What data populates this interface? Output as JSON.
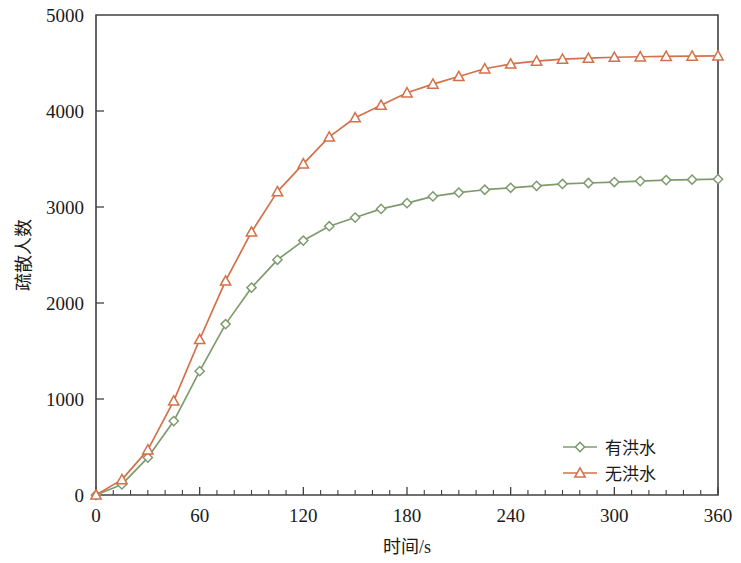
{
  "chart_data": {
    "type": "line",
    "title": "",
    "xlabel": "时间/s",
    "ylabel": "疏散人数",
    "xlim": [
      0,
      360
    ],
    "ylim": [
      0,
      5000
    ],
    "xticks": [
      0,
      60,
      120,
      180,
      240,
      300,
      360
    ],
    "xtick_labels": [
      "0",
      "60",
      "120",
      "180",
      "240",
      "300",
      "360"
    ],
    "x_minor_tick_step": 10,
    "yticks": [
      0,
      1000,
      2000,
      3000,
      4000,
      5000
    ],
    "ytick_labels": [
      "0",
      "1000",
      "2000",
      "3000",
      "4000",
      "5000"
    ],
    "grid": false,
    "legend_position": "lower-right-inside",
    "x": [
      0,
      15,
      30,
      45,
      60,
      75,
      90,
      105,
      120,
      135,
      150,
      165,
      180,
      195,
      210,
      225,
      240,
      255,
      270,
      285,
      300,
      315,
      330,
      345,
      360
    ],
    "series": [
      {
        "name": "有洪水",
        "color": "#7f9b6e",
        "marker": "diamond",
        "values": [
          0,
          110,
          390,
          770,
          1290,
          1780,
          2160,
          2450,
          2650,
          2800,
          2890,
          2980,
          3040,
          3110,
          3150,
          3180,
          3200,
          3220,
          3240,
          3250,
          3260,
          3270,
          3280,
          3285,
          3290
        ]
      },
      {
        "name": "无洪水",
        "color": "#d2714a",
        "marker": "triangle",
        "values": [
          0,
          160,
          470,
          980,
          1620,
          2230,
          2740,
          3160,
          3450,
          3730,
          3930,
          4060,
          4190,
          4280,
          4360,
          4440,
          4490,
          4520,
          4540,
          4550,
          4560,
          4565,
          4570,
          4572,
          4575
        ]
      }
    ]
  },
  "legend": {
    "items": [
      {
        "label": "有洪水",
        "color": "#7f9b6e",
        "marker": "diamond"
      },
      {
        "label": "无洪水",
        "color": "#d2714a",
        "marker": "triangle"
      }
    ]
  },
  "axes": {
    "x_title": "时间/s",
    "y_title": "疏散人数"
  }
}
